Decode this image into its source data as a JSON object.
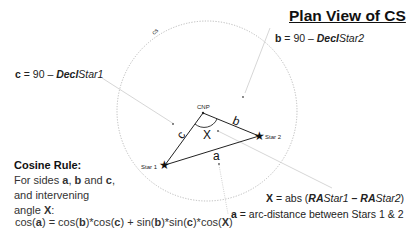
{
  "title": "Plan View of CS",
  "circle_label": "cs",
  "points": {
    "cnp": "CNP",
    "star1": "Star 1",
    "star2": "Star 2"
  },
  "sides": {
    "a": "a",
    "b": "b",
    "c": "c"
  },
  "angle": "X",
  "annotations": {
    "b_def": {
      "var": "b",
      "eq": " = 90 – ",
      "decl": "Decl",
      "star": "Star2"
    },
    "c_def": {
      "var": "c",
      "eq": " = 90 – ",
      "decl": "Decl",
      "star": "Star1"
    },
    "x_def": {
      "var": "X",
      "eq": " = abs (",
      "ra1": "RA",
      "star1": "Star1",
      "minus": " – ",
      "ra2": "RA",
      "star2": "Star2",
      "close": ")"
    },
    "a_def": {
      "var": "a",
      "eq": " = arc-distance between Stars 1 & 2"
    }
  },
  "cosine_rule": {
    "heading": "Cosine Rule:",
    "line1_pre": "For sides ",
    "line1_a": "a",
    "line1_sep1": ", ",
    "line1_b": "b",
    "line1_and": " and ",
    "line1_c": "c",
    "line1_end": ",",
    "line2": "and intervening",
    "line3_pre": "angle ",
    "line3_x": "X",
    "line3_end": ":",
    "formula": {
      "p1": "cos(",
      "a": "a",
      "p2": ") = cos(",
      "b1": "b",
      "p3": ")*cos(",
      "c1": "c",
      "p4": ") + sin(",
      "b2": "b",
      "p5": ")*sin(",
      "c2": "c",
      "p6": ")*cos(",
      "x": "X",
      "p7": ")"
    }
  },
  "colors": {
    "circle": "#aaaaaa",
    "leader": "#c8c8c8",
    "triangle": "#222222"
  }
}
